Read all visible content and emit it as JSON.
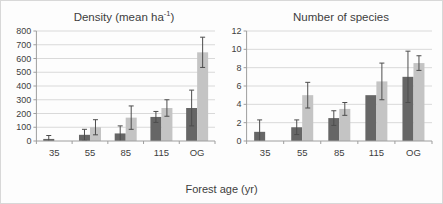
{
  "figure": {
    "xlabel": "Forest age (yr)",
    "colors": {
      "dark_series": "#666666",
      "light_series": "#c4c4c4",
      "error_bar": "#4d4d4d",
      "gridline": "#d9d9d9",
      "axis": "#9e9e9e",
      "text": "#3d3d3d",
      "background": "#fdfdfd"
    }
  },
  "chart_data": [
    {
      "type": "bar",
      "title": "Density (mean ha⁻¹)",
      "title_main": "Density (mean ha",
      "title_sup": "-1",
      "title_close": ")",
      "categories": [
        "35",
        "55",
        "85",
        "115",
        "OG"
      ],
      "series": [
        {
          "name": "dark-gray",
          "values": [
            15,
            45,
            55,
            175,
            240
          ],
          "errors": [
            25,
            40,
            55,
            40,
            130
          ]
        },
        {
          "name": "light-gray",
          "values": [
            0,
            100,
            170,
            240,
            645
          ],
          "errors": [
            0,
            55,
            85,
            60,
            110
          ]
        }
      ],
      "ylim": [
        0,
        800
      ],
      "ytick": 100,
      "grid": true,
      "legend": "none"
    },
    {
      "type": "bar",
      "title": "Number of species",
      "title_main": "Number of species",
      "title_sup": "",
      "title_close": "",
      "categories": [
        "35",
        "55",
        "85",
        "115",
        "OG"
      ],
      "series": [
        {
          "name": "dark-gray",
          "values": [
            1,
            1.5,
            2.5,
            5,
            7
          ],
          "errors": [
            1.3,
            0.8,
            0.8,
            0,
            2.8
          ]
        },
        {
          "name": "light-gray",
          "values": [
            0,
            5,
            3.5,
            6.5,
            8.5
          ],
          "errors": [
            0,
            1.4,
            0.7,
            2,
            0.8
          ]
        }
      ],
      "ylim": [
        0,
        12
      ],
      "ytick": 2,
      "grid": true,
      "legend": "none"
    }
  ]
}
